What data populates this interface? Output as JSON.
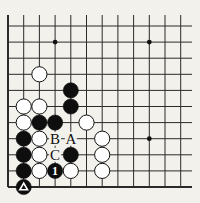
{
  "diagram": {
    "type": "go-board-fragment",
    "background": "#f3f1ec",
    "line_color": "#2a2a2a",
    "columns": 12,
    "rows": 11,
    "col_x": [
      8,
      23.7,
      39.4,
      55.1,
      70.8,
      86.5,
      102.2,
      117.9,
      133.6,
      149.3,
      165,
      180.7
    ],
    "row_y": [
      26,
      42.1,
      58.2,
      74.3,
      90.4,
      106.5,
      122.6,
      138.7,
      154.8,
      170.9,
      187
    ],
    "top_open_y": 15,
    "right_open_x": 192,
    "edges": {
      "left": true,
      "bottom": true,
      "top": false,
      "right": false
    },
    "star_points": [
      {
        "col": 3,
        "row": 1
      },
      {
        "col": 9,
        "row": 1
      },
      {
        "col": 9,
        "row": 7
      }
    ],
    "stones": [
      {
        "color": "white",
        "col": 2,
        "row": 3
      },
      {
        "color": "black",
        "col": 4,
        "row": 4
      },
      {
        "color": "black",
        "col": 4,
        "row": 5
      },
      {
        "color": "white",
        "col": 1,
        "row": 5
      },
      {
        "color": "white",
        "col": 2,
        "row": 5
      },
      {
        "color": "white",
        "col": 1,
        "row": 6
      },
      {
        "color": "black",
        "col": 2,
        "row": 6
      },
      {
        "color": "black",
        "col": 3,
        "row": 6
      },
      {
        "color": "white",
        "col": 5,
        "row": 6
      },
      {
        "color": "black",
        "col": 1,
        "row": 7
      },
      {
        "color": "white",
        "col": 2,
        "row": 7
      },
      {
        "color": "white",
        "col": 6,
        "row": 7
      },
      {
        "color": "black",
        "col": 1,
        "row": 8
      },
      {
        "color": "white",
        "col": 2,
        "row": 8
      },
      {
        "color": "black",
        "col": 4,
        "row": 8
      },
      {
        "color": "white",
        "col": 6,
        "row": 8
      },
      {
        "color": "black",
        "col": 1,
        "row": 9
      },
      {
        "color": "white",
        "col": 2,
        "row": 9
      },
      {
        "color": "black",
        "col": 3,
        "row": 9,
        "number": "1"
      },
      {
        "color": "white",
        "col": 4,
        "row": 9
      },
      {
        "color": "white",
        "col": 6,
        "row": 9
      },
      {
        "color": "black",
        "col": 1,
        "row": 10,
        "marker": "triangle"
      }
    ],
    "labels": [
      {
        "text": "B",
        "col": 3,
        "row": 7
      },
      {
        "text": "A",
        "col": 4,
        "row": 7
      },
      {
        "text": "C",
        "col": 3,
        "row": 8
      }
    ]
  }
}
